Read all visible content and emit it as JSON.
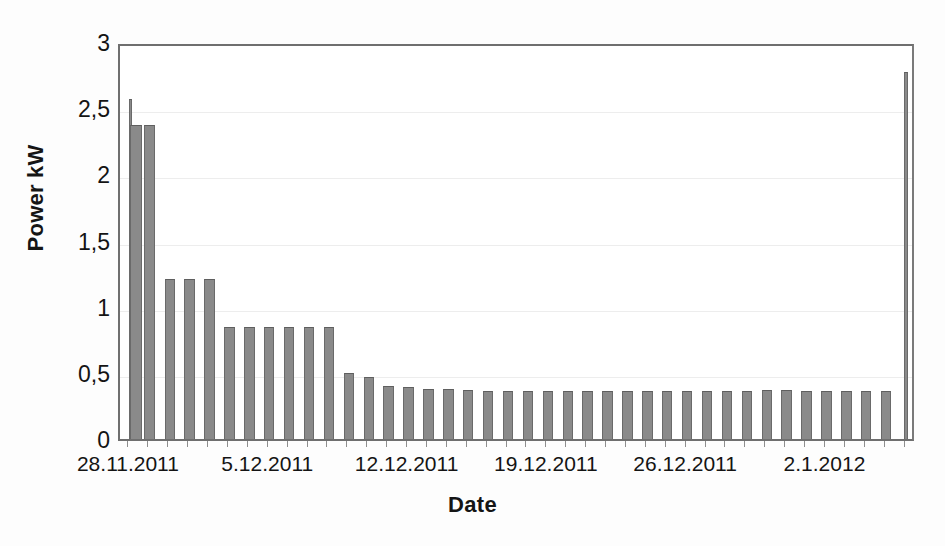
{
  "chart_data": {
    "type": "bar",
    "title": "",
    "xlabel": "Date",
    "ylabel": "Power kW",
    "ylim": [
      0,
      3
    ],
    "y_ticks": [
      "0",
      "0,5",
      "1",
      "1,5",
      "2",
      "2,5",
      "3"
    ],
    "y_tick_values": [
      0,
      0.5,
      1,
      1.5,
      2,
      2.5,
      3
    ],
    "x_tick_labels": [
      "28.11.2011",
      "5.12.2011",
      "12.12.2011",
      "19.12.2011",
      "26.12.2011",
      "2.1.2012"
    ],
    "x_tick_days": [
      0,
      7,
      14,
      21,
      28,
      35
    ],
    "grid": true,
    "legend": null,
    "series_name": "Power kW",
    "bar_color": "#8a8a8a",
    "xlim_days": [
      -0.5,
      39.5
    ],
    "note": "Values read per-bar from the plot; each bar is one measurement interval.",
    "categories": [
      "28.11.2011",
      "29.11.2011",
      "30.11.2011",
      "1.12.2011",
      "2.12.2011",
      "3.12.2011",
      "4.12.2011",
      "5.12.2011",
      "6.12.2011",
      "7.12.2011",
      "8.12.2011",
      "9.12.2011",
      "10.12.2011",
      "11.12.2011",
      "12.12.2011",
      "13.12.2011",
      "14.12.2011",
      "15.12.2011",
      "16.12.2011",
      "17.12.2011",
      "18.12.2011",
      "19.12.2011",
      "20.12.2011",
      "21.12.2011",
      "22.12.2011",
      "23.12.2011",
      "24.12.2011",
      "25.12.2011",
      "26.12.2011",
      "27.12.2011",
      "28.12.2011",
      "29.12.2011",
      "30.12.2011",
      "31.12.2011",
      "1.1.2012",
      "2.1.2012",
      "3.1.2012",
      "4.1.2012",
      "5.1.2012",
      "6.1.2012"
    ],
    "values": [
      2.57,
      2.37,
      1.21,
      1.21,
      1.21,
      0.85,
      0.85,
      0.85,
      0.85,
      0.85,
      0.85,
      0.5,
      0.47,
      0.4,
      0.39,
      0.38,
      0.38,
      0.37,
      0.36,
      0.36,
      0.36,
      0.36,
      0.36,
      0.36,
      0.36,
      0.36,
      0.36,
      0.36,
      0.36,
      0.36,
      0.36,
      0.36,
      0.37,
      0.37,
      0.36,
      0.36,
      0.36,
      0.36,
      0.36,
      2.77
    ],
    "sub_bars": [
      {
        "day": 0.02,
        "value": 2.57,
        "width_days": 0.18
      },
      {
        "day": 0.3,
        "value": 2.37,
        "width_days": 0.62
      }
    ]
  }
}
